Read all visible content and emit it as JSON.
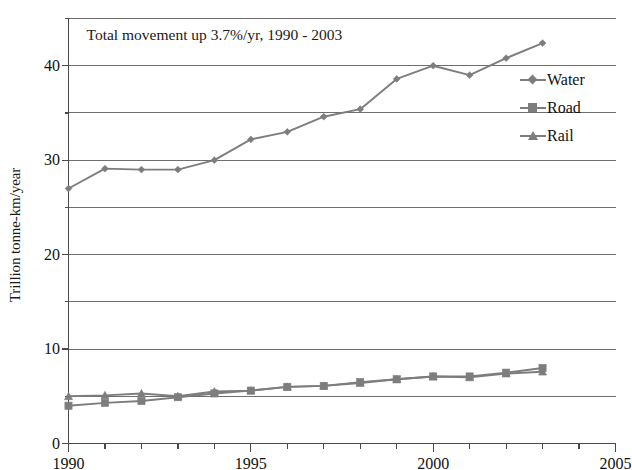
{
  "chart_data": {
    "type": "line",
    "title": "",
    "annotation": "Total movement up 3.7%/yr, 1990 - 2003",
    "xlabel": "",
    "ylabel": "Trillion tonne-km/year",
    "x": [
      1990,
      1991,
      1992,
      1993,
      1994,
      1995,
      1996,
      1997,
      1998,
      1999,
      2000,
      2001,
      2002,
      2003
    ],
    "xlim": [
      1990,
      2005
    ],
    "ylim": [
      0,
      45
    ],
    "x_ticks_major": [
      1990,
      1995,
      2000,
      2005
    ],
    "x_tick_labels": [
      "1990",
      "1995",
      "2000",
      "2005"
    ],
    "x_ticks_minor_step": 1,
    "y_ticks": [
      0,
      5,
      10,
      15,
      20,
      25,
      30,
      35,
      40,
      45
    ],
    "y_tick_labels": [
      "0",
      "",
      "10",
      "",
      "20",
      "",
      "30",
      "",
      "40",
      ""
    ],
    "y_labeled_ticks": [
      0,
      10,
      20,
      30,
      40
    ],
    "grid": "horizontal",
    "legend_position": "right-inside",
    "series": [
      {
        "name": "Water",
        "marker": "diamond",
        "color": "#7d7d7d",
        "values": [
          27.0,
          29.1,
          29.0,
          29.0,
          30.0,
          32.2,
          33.0,
          34.6,
          35.4,
          38.6,
          40.0,
          39.0,
          40.8,
          42.4
        ]
      },
      {
        "name": "Road",
        "marker": "square",
        "color": "#7d7d7d",
        "values": [
          4.0,
          4.3,
          4.5,
          4.9,
          5.3,
          5.6,
          6.0,
          6.1,
          6.5,
          6.8,
          7.1,
          7.1,
          7.5,
          8.0
        ]
      },
      {
        "name": "Rail",
        "marker": "triangle",
        "color": "#7d7d7d",
        "values": [
          5.0,
          5.1,
          5.3,
          5.0,
          5.5,
          5.6,
          6.0,
          6.1,
          6.4,
          6.8,
          7.1,
          7.0,
          7.4,
          7.6
        ]
      }
    ]
  },
  "legend": {
    "items": [
      {
        "label": "Water"
      },
      {
        "label": "Road"
      },
      {
        "label": "Rail"
      }
    ]
  },
  "axes": {
    "y_title": "Trillion tonne-km/year"
  },
  "colors": {
    "line": "#7d7d7d",
    "grid": "#6e6e6e",
    "axis": "#4a4a4a",
    "text": "#1a1a1a",
    "background": "#ffffff"
  }
}
